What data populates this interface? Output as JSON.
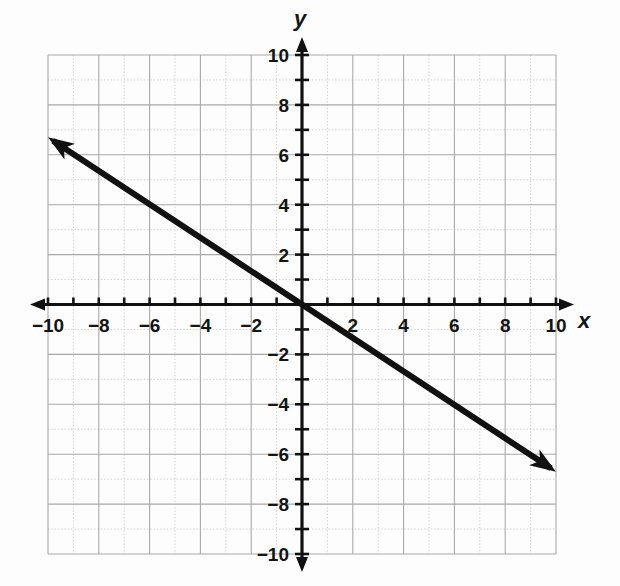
{
  "chart_data": {
    "type": "line",
    "title": "",
    "xlabel": "x",
    "ylabel": "y",
    "xlim": [
      -10,
      10
    ],
    "ylim": [
      -10,
      10
    ],
    "grid": true,
    "grid_major_step": 2,
    "grid_minor_step": 1,
    "tick_step": 1,
    "legend": "none",
    "x_tick_labels": [
      "-10",
      "-8",
      "-6",
      "-4",
      "-2",
      "2",
      "4",
      "6",
      "8",
      "10"
    ],
    "x_tick_values": [
      -10,
      -8,
      -6,
      -4,
      -2,
      2,
      4,
      6,
      8,
      10
    ],
    "y_tick_labels": [
      "10",
      "8",
      "6",
      "4",
      "2",
      "-2",
      "-4",
      "-6",
      "-8",
      "-10"
    ],
    "y_tick_values": [
      10,
      8,
      6,
      4,
      2,
      -2,
      -4,
      -6,
      -8,
      -10
    ],
    "series": [
      {
        "name": "line",
        "equation": "y = -2/3 x",
        "slope": -0.6666666667,
        "intercept": 0,
        "color": "#111111",
        "arrows": "both",
        "x": [
          -10,
          10
        ],
        "values": [
          6.6666666667,
          -6.6666666667
        ],
        "endpoints": [
          {
            "x": -10,
            "y": 6.7
          },
          {
            "x": 10,
            "y": -6.7
          }
        ],
        "lattice_points": [
          {
            "x": -9,
            "y": 6
          },
          {
            "x": -6,
            "y": 4
          },
          {
            "x": -3,
            "y": 2
          },
          {
            "x": 0,
            "y": 0
          },
          {
            "x": 3,
            "y": -2
          },
          {
            "x": 6,
            "y": -4
          },
          {
            "x": 9,
            "y": -6
          }
        ]
      }
    ],
    "colors": {
      "background": "#fdfdfd",
      "axis": "#111111",
      "grid_major": "#a9a9a9",
      "grid_minor": "#cfcfcf",
      "line": "#111111",
      "tick_text": "#141414"
    }
  },
  "axes": {
    "x_axis_label": "x",
    "y_axis_label": "y"
  }
}
